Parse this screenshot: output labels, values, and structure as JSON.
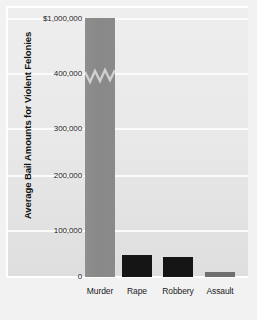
{
  "chart_data": {
    "type": "bar",
    "title": "",
    "subtitle": "",
    "xlabel": "",
    "ylabel": "Average Bail Amounts for Violent Felonies",
    "categories": [
      "Murder",
      "Rape",
      "Robbery",
      "Assault"
    ],
    "values": [
      1000000,
      55000,
      52000,
      5000
    ],
    "series": [
      {
        "name": "Average Bail Amount",
        "values": [
          1000000,
          55000,
          52000,
          5000
        ]
      }
    ],
    "ytick_labels": [
      "0",
      "100,000",
      "200,000",
      "300,000",
      "400,000",
      "$1,000,000"
    ],
    "ytick_values": [
      0,
      100000,
      200000,
      300000,
      400000,
      1000000
    ],
    "ylim": [
      0,
      1000000
    ],
    "axis_break": true,
    "axis_break_note": "Y-axis is broken between 400,000 and $1,000,000; Murder bar shows a zigzag break symbol",
    "grid": true,
    "grid_axis": "y",
    "legend": false,
    "legend_position": "none",
    "bar_colors": [
      "#8a8a8a",
      "#151515",
      "#151515",
      "#6f6f6f"
    ],
    "plot_background": "#e8e8e8",
    "gridline_color": "#fbfbfb",
    "text_color": "#1a1a1a"
  },
  "axis": {
    "y_title": "Average Bail Amounts for Violent Felonies",
    "ticks": [
      {
        "label": "$1,000,000",
        "value": 1000000,
        "top": 18
      },
      {
        "label": "400,000",
        "value": 400000,
        "top": 73
      },
      {
        "label": "300,000",
        "value": 300000,
        "top": 128
      },
      {
        "label": "200,000",
        "value": 200000,
        "top": 175
      },
      {
        "label": "100,000",
        "value": 100000,
        "top": 230
      },
      {
        "label": "0",
        "value": 0,
        "top": 276
      }
    ]
  },
  "bars": [
    {
      "label": "Murder",
      "value": 1000000,
      "left": 85,
      "width": 30,
      "top": 18,
      "height": 259,
      "color": "#8a8a8a",
      "broken": true
    },
    {
      "label": "Rape",
      "value": 55000,
      "left": 122,
      "width": 30,
      "top": 255,
      "height": 22,
      "color": "#151515",
      "broken": false
    },
    {
      "label": "Robbery",
      "value": 52000,
      "left": 163,
      "width": 30,
      "top": 257,
      "height": 20,
      "color": "#151515",
      "broken": false
    },
    {
      "label": "Assault",
      "value": 5000,
      "left": 205,
      "width": 30,
      "top": 272,
      "height": 5,
      "color": "#6f6f6f",
      "broken": false
    }
  ],
  "category_labels": [
    {
      "text": "Murder",
      "center": 100
    },
    {
      "text": "Rape",
      "center": 137
    },
    {
      "text": "Robbery",
      "center": 178
    },
    {
      "text": "Assault",
      "center": 220
    }
  ]
}
